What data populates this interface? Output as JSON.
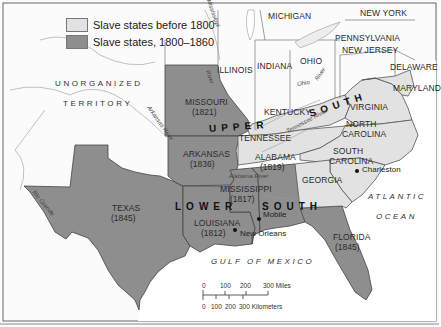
{
  "legend": {
    "items": [
      {
        "label": "Slave states before 1800",
        "color": "#e2e2e2"
      },
      {
        "label": "Slave states, 1800–1860",
        "color": "#8e8e8e"
      }
    ]
  },
  "colors": {
    "free_land": "#fbfbfb",
    "slave_before_1800": "#e2e2e2",
    "slave_1800_1860": "#8e8e8e",
    "water": "#ffffff",
    "border": "#555555"
  },
  "states": {
    "michigan": {
      "name": "MICHIGAN"
    },
    "new_york": {
      "name": "NEW YORK"
    },
    "pennsylvania": {
      "name": "PENNSYLVANIA"
    },
    "new_jersey": {
      "name": "NEW JERSEY"
    },
    "delaware": {
      "name": "DELAWARE"
    },
    "maryland": {
      "name": "MARYLAND"
    },
    "illinois": {
      "name": "ILLINOIS"
    },
    "indiana": {
      "name": "INDIANA"
    },
    "ohio": {
      "name": "OHIO"
    },
    "kentucky": {
      "name": "KENTUCKY"
    },
    "virginia": {
      "name": "VIRGINIA"
    },
    "north_carolina": {
      "name_line1": "NORTH",
      "name_line2": "CAROLINA"
    },
    "south_carolina": {
      "name_line1": "SOUTH",
      "name_line2": "CAROLINA"
    },
    "georgia": {
      "name": "GEORGIA"
    },
    "tennessee": {
      "name": "TENNESSEE"
    },
    "missouri": {
      "name": "MISSOURI",
      "year": "(1821)"
    },
    "arkansas": {
      "name": "ARKANSAS",
      "year": "(1836)"
    },
    "alabama": {
      "name": "ALABAMA",
      "year": "(1819)"
    },
    "mississippi": {
      "name": "MISSISSIPPI",
      "year": "(1817)"
    },
    "louisiana": {
      "name": "LOUISIANA",
      "year": "(1812)"
    },
    "texas": {
      "name": "TEXAS",
      "year": "(1845)"
    },
    "florida": {
      "name": "FLORIDA",
      "year": "(1845)"
    }
  },
  "regions": {
    "upper": "UPPER",
    "south_upper": "SOUTH",
    "lower": "LOWER",
    "south_lower": "SOUTH"
  },
  "territory": {
    "line1": "UNORGANIZED",
    "line2": "TERRITORY"
  },
  "water": {
    "atlantic_line1": "ATLANTIC",
    "atlantic_line2": "OCEAN",
    "gulf": "GULF OF MEXICO"
  },
  "rivers": {
    "mississippi": "Mississippi",
    "river": "River",
    "ohio": "Ohio",
    "ohio_river": "River",
    "arkansas": "Arkansas River",
    "tennessee": "Tennessee River",
    "alabama": "Alabama River",
    "rio_grande": "Rio Grande"
  },
  "cities": {
    "charleston": "Charleston",
    "mobile": "Mobile",
    "new_orleans": "New Orleans"
  },
  "scale": {
    "miles": [
      "0",
      "100",
      "200",
      "300 Miles"
    ],
    "kilometers": [
      "0",
      "100",
      "200",
      "300 Kilometers"
    ]
  }
}
